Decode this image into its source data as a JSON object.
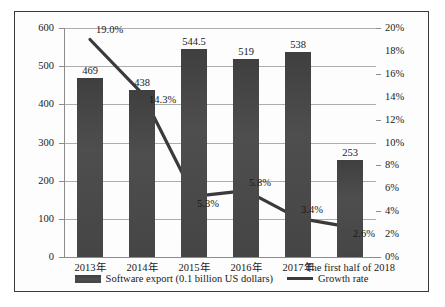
{
  "chart_data": {
    "type": "bar",
    "title": "",
    "xlabel": "",
    "ylabel": "",
    "grid": true,
    "legend_position": "bottom",
    "categories": [
      "2013年",
      "2014年",
      "2015年",
      "2016年",
      "2017年",
      "The first half of 2018"
    ],
    "series": [
      {
        "name": "Software export (0.1 billion US dollars)",
        "type": "bar",
        "axis": "left",
        "values": [
          469,
          438,
          544.5,
          519,
          538,
          253
        ],
        "labels": [
          "469",
          "438",
          "544.5",
          "519",
          "538",
          "253"
        ]
      },
      {
        "name": "Growth rate",
        "type": "line",
        "axis": "right",
        "values": [
          19.0,
          14.3,
          5.3,
          5.8,
          3.4,
          2.6
        ],
        "labels": [
          "19.0%",
          "14.3%",
          "5.3%",
          "5.8%",
          "3.4%",
          "2.6%"
        ]
      }
    ],
    "left_axis": {
      "label": "",
      "ylim": [
        0,
        600
      ],
      "step": 100,
      "ticks": [
        "600",
        "500",
        "400",
        "300",
        "200",
        "100",
        "0"
      ]
    },
    "right_axis": {
      "label": "",
      "ylim": [
        0,
        20
      ],
      "step": 2,
      "ticks": [
        "20%",
        "18%",
        "16%",
        "14%",
        "12%",
        "10%",
        "8%",
        "6%",
        "4%",
        "2%",
        "0%"
      ]
    },
    "colors": {
      "bar": "#4a4a4a",
      "line": "#3a3a3a",
      "grid": "#adadad",
      "axis": "#8c8c8c",
      "frame": "#3a3a3a",
      "text": "#1a1a1a",
      "background": "#ffffff"
    }
  },
  "legend": {
    "items": [
      {
        "label": "Software export (0.1 billion US dollars)",
        "marker": "bar-swatch"
      },
      {
        "label": "Growth rate",
        "marker": "line-swatch"
      }
    ]
  }
}
